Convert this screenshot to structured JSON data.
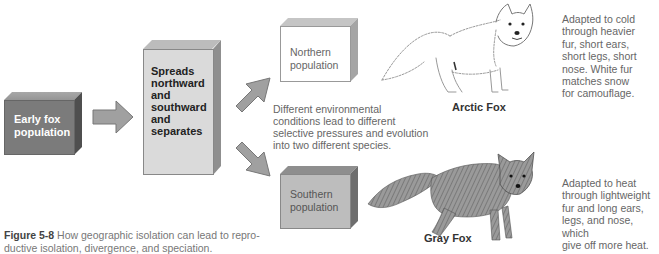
{
  "diagram": {
    "early_box": {
      "label_line1": "Early fox",
      "label_line2": "population",
      "color": "#7d7d7d"
    },
    "spread_box": {
      "lines": [
        "Spreads",
        "northward",
        "and",
        "southward",
        "and",
        "separates"
      ],
      "color": "#d9d9d9"
    },
    "northern_box": {
      "label_line1": "Northern",
      "label_line2": "population",
      "color": "#ffffff"
    },
    "southern_box": {
      "label_line1": "Southern",
      "label_line2": "population",
      "color": "#bdbdbd"
    },
    "middle_text": [
      "Different environmental",
      "conditions lead to different",
      "selective pressures and evolution",
      "into two different species."
    ],
    "arctic_fox": {
      "name": "Arctic Fox",
      "description": [
        "Adapted to cold",
        "through heavier",
        "fur, short ears,",
        "short legs, short",
        "nose. White fur",
        "matches snow",
        "for camouflage."
      ]
    },
    "gray_fox": {
      "name": "Gray Fox",
      "description": [
        "Adapted to heat",
        "through lightweight",
        "fur and long ears,",
        "legs, and nose, which",
        "give off more heat."
      ]
    },
    "arrow_color": "#a0a0a0"
  },
  "caption": {
    "label": "Figure 5-8",
    "line1": "How geographic isolation can lead to repro-",
    "line2": "ductive isolation, divergence, and speciation."
  }
}
